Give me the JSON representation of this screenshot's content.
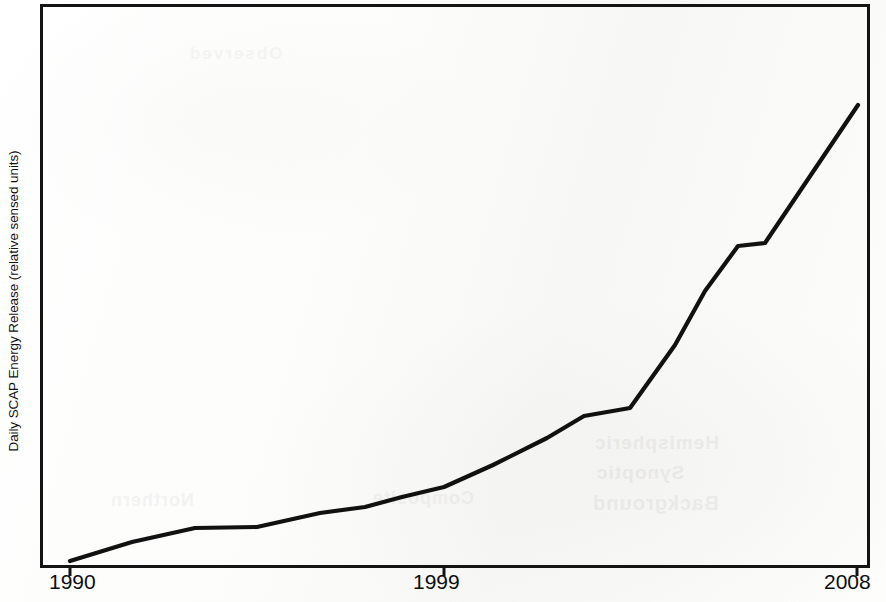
{
  "figure": {
    "width": 886,
    "height": 602,
    "background_color": "#fdfdfc",
    "line_color": "#111111",
    "axis_color": "#111111"
  },
  "axis_titles": {
    "y": "Daily SCAP Energy Release (relative sensed units)",
    "x": ""
  },
  "x_tick_labels": {
    "first": "1990",
    "middle": "1999",
    "last": "2008"
  },
  "ghost_text": {
    "line1": "Hemispheric",
    "line2": "Synoptic",
    "line3": "Background",
    "line4": "Northern",
    "line5": "Composite",
    "line6": "Observed"
  },
  "chart_data": {
    "type": "line",
    "title": "",
    "subtitle": "",
    "xlabel": "",
    "ylabel": "Daily SCAP Energy Release (relative sensed units)",
    "x_tick_labels": [
      "1990",
      "1999",
      "2008"
    ],
    "x_tick_values": [
      1990,
      1999,
      2008
    ],
    "y_tick_labels": [],
    "xlim": [
      1990,
      2008
    ],
    "ylim": [
      0,
      100
    ],
    "grid": false,
    "legend": null,
    "legend_position": "none",
    "annotations": [],
    "series": [
      {
        "name": "Daily SCAP Energy Release",
        "color": "#111111",
        "line_width": 4,
        "markers": false,
        "x": [
          1990.0,
          1991.5,
          1993.0,
          1994.5,
          1996.0,
          1997.1,
          1998.0,
          1999.0,
          2000.2,
          2001.5,
          2002.4,
          2003.5,
          2004.6,
          2005.3,
          2006.0,
          2006.6,
          2008.0
        ],
        "y": [
          0.0,
          3.4,
          5.9,
          8.2,
          10.6,
          11.9,
          13.4,
          15.7,
          19.9,
          24.6,
          29.4,
          37.1,
          47.6,
          55.6,
          57.3,
          58.0,
          81.3
        ],
        "x_pixels": [
          70,
          132,
          195,
          257,
          320,
          365,
          402,
          444,
          493,
          547,
          584,
          630,
          675,
          705,
          738,
          765,
          858
        ],
        "y_pixels": [
          561,
          542,
          528,
          527,
          513,
          507,
          497,
          487,
          465,
          438,
          416,
          408,
          345,
          291,
          246,
          243,
          105
        ]
      }
    ]
  }
}
